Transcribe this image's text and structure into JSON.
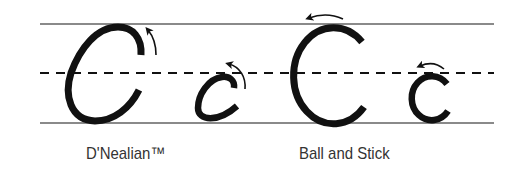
{
  "figure": {
    "colors": {
      "background": "#ffffff",
      "guide_line": "#8a8a8a",
      "stroke": "#111111",
      "label_text": "#333333"
    },
    "guide_lines": {
      "top": "solid",
      "middle": "dashed",
      "bottom": "solid"
    },
    "styles": [
      {
        "name": "D'Nealian™",
        "letters": [
          {
            "glyph": "C",
            "case": "uppercase",
            "direction_arrow": "upward-curved"
          },
          {
            "glyph": "c",
            "case": "lowercase",
            "direction_arrow": "upward-curved"
          }
        ]
      },
      {
        "name": "Ball and Stick",
        "letters": [
          {
            "glyph": "C",
            "case": "uppercase",
            "direction_arrow": "leftward-curved"
          },
          {
            "glyph": "c",
            "case": "lowercase",
            "direction_arrow": "leftward-curved"
          }
        ]
      }
    ]
  }
}
